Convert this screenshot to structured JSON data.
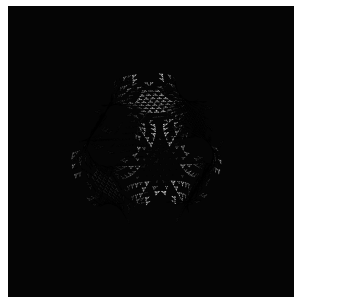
{
  "figure": {
    "render_style": "wireframe-shaded-mesh",
    "width_px": 338,
    "height_px": 308
  },
  "canvas": {
    "page_background": "#ffffff",
    "plot_background": "#050505",
    "plot_rect": {
      "x": 8,
      "y": 6,
      "width": 286,
      "height": 291
    }
  },
  "mesh": {
    "edge_color": "#000000",
    "surface_light": "#b4b4b4",
    "surface_mid": "#8c8c8c",
    "surface_dark": "#1a1a1a",
    "edge_width": 0.45,
    "triangulation": "triangular",
    "u_divisions": 46,
    "v_divisions": 46
  },
  "geometry": {
    "type": "schwarz-p",
    "description": "Schwarz P triply periodic minimal surface, 2x2x2 unit cells, nodal approximation cos(x)+cos(y)+cos(z)=0",
    "cells_x": 2,
    "cells_y": 2,
    "cells_z": 2,
    "iso_level": 0.0,
    "lobes_visible": 7,
    "tunnel_openings_visible": 5
  },
  "camera": {
    "azimuth_deg": 34,
    "elevation_deg": 22,
    "roll_deg": 6,
    "scale": 1.0,
    "center_x": 150,
    "center_y": 152
  },
  "lighting": {
    "type": "directional",
    "direction": [
      -0.45,
      -0.62,
      0.64
    ],
    "ambient": 0.2,
    "diffuse": 0.85
  },
  "chart_data": {
    "type": "scatter",
    "xlabel": "",
    "ylabel": "",
    "categories": [],
    "values": []
  }
}
